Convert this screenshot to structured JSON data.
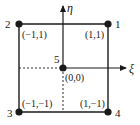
{
  "diagram": {
    "title": "",
    "nodes": [
      {
        "id": "1",
        "coord": "(1,1)"
      },
      {
        "id": "2",
        "coord": "(−1,1)"
      },
      {
        "id": "3",
        "coord": "(−1,−1)"
      },
      {
        "id": "4",
        "coord": "(1,−1)"
      },
      {
        "id": "5",
        "coord": "(0,0)"
      }
    ],
    "axes": {
      "horizontal": "ξ",
      "vertical": "η"
    },
    "colors": {
      "line": "#1a1a1a",
      "background": "#ffffff"
    }
  }
}
